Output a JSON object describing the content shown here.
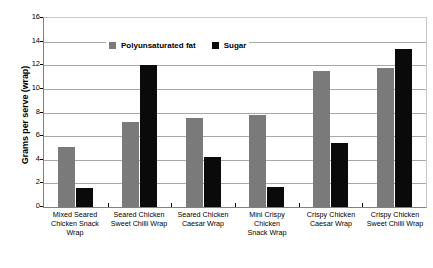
{
  "chart_data": {
    "type": "bar",
    "title": "",
    "xlabel": "",
    "ylabel": "Grams per serve (wrap)",
    "ylim": [
      0,
      16
    ],
    "ytick_step": 2,
    "yticks": [
      "16",
      "14",
      "12",
      "10",
      "8",
      "6",
      "4",
      "2",
      "0"
    ],
    "grid": true,
    "legend_position": "top-left-inside",
    "categories": [
      "Mixed Seared Chicken Snack Wrap",
      "Seared Chicken Sweet Chilli Wrap",
      "Seared Chicken Caesar Wrap",
      "Mini Crispy Chicken Snack Wrap",
      "Crispy Chicken Caesar Wrap",
      "Crispy Chicken Sweet Chilli Wrap"
    ],
    "category_lines": [
      [
        "Mixed Seared",
        "Chicken Snack Wrap"
      ],
      [
        "Seared Chicken",
        "Sweet Chilli Wrap"
      ],
      [
        "Seared Chicken",
        "Caesar Wrap"
      ],
      [
        "Mini Crispy Chicken",
        "Snack Wrap"
      ],
      [
        "Crispy Chicken",
        "Caesar Wrap"
      ],
      [
        "Crispy Chicken",
        "Sweet Chilli Wrap"
      ]
    ],
    "series": [
      {
        "name": "Polyunsaturated fat",
        "color": "#7a7a7a",
        "values": [
          5.1,
          7.2,
          7.5,
          7.8,
          11.5,
          11.8
        ]
      },
      {
        "name": "Sugar",
        "color": "#0a0a0a",
        "values": [
          1.6,
          12.0,
          4.2,
          1.7,
          5.4,
          13.4
        ]
      }
    ]
  },
  "legend": {
    "items": [
      {
        "label": "Polyunsaturated fat",
        "swatch": "fat"
      },
      {
        "label": "Sugar",
        "swatch": "sugar"
      }
    ]
  },
  "axis": {
    "y_title": "Grams per serve (wrap)"
  }
}
